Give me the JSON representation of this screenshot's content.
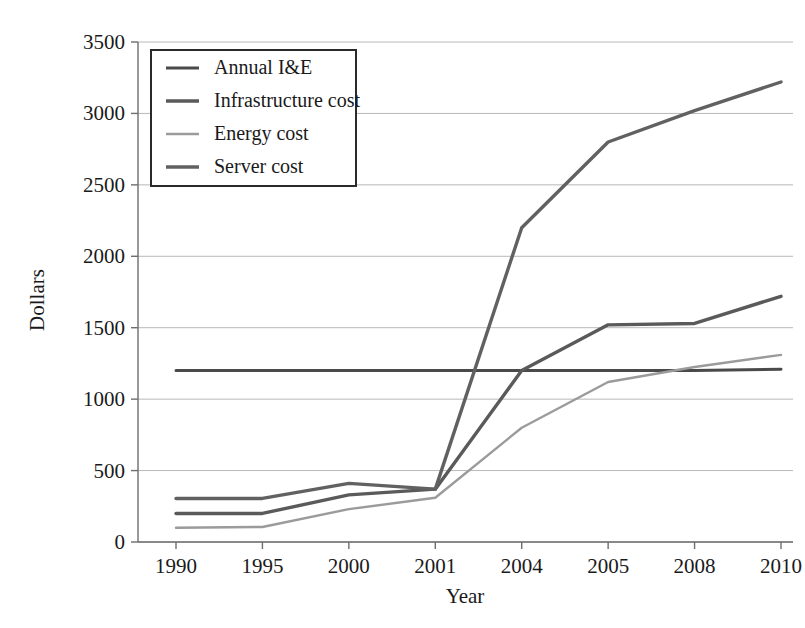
{
  "chart_data": {
    "type": "line",
    "title": "",
    "xlabel": "Year",
    "ylabel": "Dollars",
    "categories": [
      "1990",
      "1995",
      "2000",
      "2001",
      "2004",
      "2005",
      "2008",
      "2010"
    ],
    "ylim": [
      0,
      3500
    ],
    "yticks": [
      0,
      500,
      1000,
      1500,
      2000,
      2500,
      3000,
      3500
    ],
    "ytick_labels": [
      "0",
      "500",
      "1000",
      "1500",
      "2000",
      "2500",
      "3000",
      "3500"
    ],
    "grid": true,
    "grid_axis": "y",
    "legend_position": "upper left",
    "series": [
      {
        "name": "Annual I&E",
        "color": "#4a4a4a",
        "width": 3.0,
        "values": [
          1200,
          1200,
          1200,
          1200,
          1200,
          1200,
          1200,
          1210
        ]
      },
      {
        "name": "Infrastructure cost",
        "color": "#5a5a5a",
        "width": 3.4,
        "values": [
          200,
          200,
          330,
          370,
          1200,
          1520,
          1530,
          1720
        ]
      },
      {
        "name": "Energy cost",
        "color": "#9b9b9b",
        "width": 2.4,
        "values": [
          100,
          105,
          230,
          310,
          800,
          1120,
          1225,
          1310
        ]
      },
      {
        "name": "Server cost",
        "color": "#616161",
        "width": 3.4,
        "values": [
          305,
          305,
          410,
          370,
          2200,
          2800,
          3020,
          3220
        ]
      }
    ]
  },
  "axes": {
    "x_axis_title": "Year",
    "y_axis_title": "Dollars"
  },
  "legend": {
    "items": [
      {
        "label": "Annual I&E"
      },
      {
        "label": "Infrastructure cost"
      },
      {
        "label": "Energy cost"
      },
      {
        "label": "Server cost"
      }
    ]
  }
}
